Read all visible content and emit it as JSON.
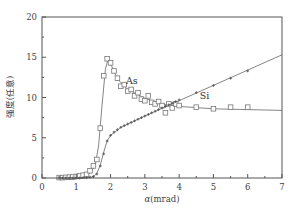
{
  "chart_data": {
    "type": "line",
    "title": "",
    "xlabel": "α(mrad)",
    "ylabel": "强度(任意)",
    "xlim": [
      0,
      7
    ],
    "ylim": [
      0,
      20
    ],
    "x_ticks": [
      0,
      1,
      2,
      3,
      4,
      5,
      6,
      7
    ],
    "y_ticks": [
      0,
      5,
      10,
      15,
      20
    ],
    "grid": false,
    "legend": "none (inline labels)",
    "annotations": [
      {
        "text": "As",
        "x": 2.45,
        "y": 12.1
      },
      {
        "text": "Si",
        "x": 4.6,
        "y": 10.2
      }
    ],
    "series": [
      {
        "name": "As",
        "marker": "open-square",
        "markers": [
          [
            0.5,
            0.05
          ],
          [
            0.6,
            0.05
          ],
          [
            0.7,
            0.08
          ],
          [
            0.8,
            0.1
          ],
          [
            0.9,
            0.12
          ],
          [
            1.0,
            0.2
          ],
          [
            1.1,
            0.25
          ],
          [
            1.2,
            0.35
          ],
          [
            1.3,
            0.45
          ],
          [
            1.4,
            0.9
          ],
          [
            1.5,
            1.5
          ],
          [
            1.6,
            2.3
          ],
          [
            1.7,
            6.2
          ],
          [
            1.8,
            12.7
          ],
          [
            1.9,
            14.8
          ],
          [
            2.0,
            14.3
          ],
          [
            2.1,
            13.3
          ],
          [
            2.2,
            12.4
          ],
          [
            2.3,
            11.4
          ],
          [
            2.4,
            11.6
          ],
          [
            2.5,
            10.8
          ],
          [
            2.6,
            11.0
          ],
          [
            2.7,
            10.2
          ],
          [
            2.8,
            10.6
          ],
          [
            2.9,
            9.8
          ],
          [
            3.0,
            9.6
          ],
          [
            3.1,
            10.2
          ],
          [
            3.2,
            9.4
          ],
          [
            3.3,
            9.2
          ],
          [
            3.4,
            9.5
          ],
          [
            3.5,
            9.0
          ],
          [
            3.6,
            8.1
          ],
          [
            3.7,
            9.2
          ],
          [
            3.8,
            8.7
          ],
          [
            3.9,
            9.2
          ],
          [
            4.0,
            9.0
          ],
          [
            4.5,
            8.8
          ],
          [
            5.0,
            8.6
          ],
          [
            5.5,
            8.8
          ],
          [
            6.0,
            8.8
          ]
        ],
        "curve": [
          [
            0.5,
            0.0
          ],
          [
            1.0,
            0.1
          ],
          [
            1.4,
            0.6
          ],
          [
            1.55,
            1.5
          ],
          [
            1.65,
            4.0
          ],
          [
            1.75,
            9.0
          ],
          [
            1.85,
            13.5
          ],
          [
            1.92,
            14.7
          ],
          [
            2.0,
            14.2
          ],
          [
            2.2,
            12.3
          ],
          [
            2.5,
            11.0
          ],
          [
            3.0,
            9.9
          ],
          [
            3.5,
            9.2
          ],
          [
            4.0,
            8.9
          ],
          [
            5.0,
            8.6
          ],
          [
            6.0,
            8.5
          ],
          [
            7.0,
            8.4
          ]
        ]
      },
      {
        "name": "Si",
        "marker": "small-plus",
        "markers": [
          [
            0.5,
            0.0
          ],
          [
            0.6,
            0.0
          ],
          [
            0.7,
            0.0
          ],
          [
            0.8,
            0.0
          ],
          [
            0.9,
            0.0
          ],
          [
            1.0,
            0.0
          ],
          [
            1.1,
            0.0
          ],
          [
            1.2,
            0.05
          ],
          [
            1.3,
            0.05
          ],
          [
            1.4,
            0.1
          ],
          [
            1.5,
            0.2
          ],
          [
            1.6,
            0.5
          ],
          [
            1.7,
            1.5
          ],
          [
            1.8,
            3.0
          ],
          [
            1.9,
            4.6
          ],
          [
            2.0,
            5.3
          ],
          [
            2.1,
            5.7
          ],
          [
            2.2,
            6.0
          ],
          [
            2.3,
            6.3
          ],
          [
            2.4,
            6.5
          ],
          [
            2.5,
            6.7
          ],
          [
            2.6,
            6.9
          ],
          [
            2.7,
            7.1
          ],
          [
            2.8,
            7.3
          ],
          [
            2.9,
            7.5
          ],
          [
            3.0,
            7.7
          ],
          [
            3.1,
            7.9
          ],
          [
            3.2,
            8.1
          ],
          [
            3.3,
            8.3
          ],
          [
            3.4,
            8.5
          ],
          [
            3.5,
            8.7
          ],
          [
            3.6,
            8.9
          ],
          [
            3.7,
            9.1
          ],
          [
            3.8,
            9.3
          ],
          [
            3.9,
            9.5
          ],
          [
            4.0,
            9.7
          ],
          [
            4.5,
            10.6
          ],
          [
            5.0,
            11.5
          ],
          [
            5.5,
            12.4
          ],
          [
            6.0,
            13.3
          ]
        ],
        "curve": [
          [
            0.5,
            0.0
          ],
          [
            1.3,
            0.0
          ],
          [
            1.5,
            0.15
          ],
          [
            1.6,
            0.6
          ],
          [
            1.7,
            1.6
          ],
          [
            1.8,
            3.2
          ],
          [
            1.9,
            4.6
          ],
          [
            2.0,
            5.3
          ],
          [
            2.3,
            6.3
          ],
          [
            3.0,
            7.7
          ],
          [
            4.0,
            9.6
          ],
          [
            5.0,
            11.5
          ],
          [
            6.0,
            13.4
          ],
          [
            7.0,
            15.3
          ]
        ]
      }
    ]
  }
}
